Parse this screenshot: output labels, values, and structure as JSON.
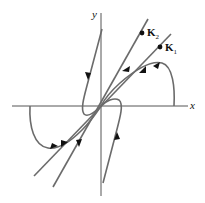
{
  "diagram": {
    "type": "phase-portrait",
    "axes": {
      "x_label": "x",
      "y_label": "y"
    },
    "eigenvector_labels": [
      {
        "name": "K",
        "sub": "2"
      },
      {
        "name": "K",
        "sub": "1"
      }
    ],
    "colors": {
      "trajectory": "#6b6b6b",
      "axis": "#555555",
      "arrow": "#111111",
      "text": "#111111"
    }
  }
}
